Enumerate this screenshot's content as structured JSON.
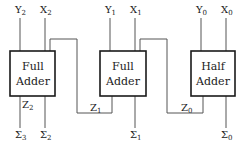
{
  "diagram": {
    "type": "ripple-carry adder block diagram",
    "blocks": [
      {
        "id": "fa2",
        "line1": "Full",
        "line2": "Adder"
      },
      {
        "id": "fa1",
        "line1": "Full",
        "line2": "Adder"
      },
      {
        "id": "ha0",
        "line1": "Half",
        "line2": "Adder"
      }
    ],
    "labels": {
      "y2": {
        "base": "Y",
        "sub": "2"
      },
      "x2": {
        "base": "X",
        "sub": "2"
      },
      "y1": {
        "base": "Y",
        "sub": "1"
      },
      "x1": {
        "base": "X",
        "sub": "1"
      },
      "y0": {
        "base": "Y",
        "sub": "0"
      },
      "x0": {
        "base": "X",
        "sub": "0"
      },
      "z2": {
        "base": "Z",
        "sub": "2"
      },
      "z1": {
        "base": "Z",
        "sub": "1"
      },
      "z0": {
        "base": "Z",
        "sub": "0"
      },
      "s3": {
        "base": "Σ",
        "sub": "3"
      },
      "s2": {
        "base": "Σ",
        "sub": "2"
      },
      "s1": {
        "base": "Σ",
        "sub": "1"
      },
      "s0": {
        "base": "Σ",
        "sub": "0"
      }
    },
    "connections": [
      {
        "from": "ha0",
        "signal": "Z0",
        "to": "fa1"
      },
      {
        "from": "fa1",
        "signal": "Z1",
        "to": "fa2"
      }
    ]
  }
}
